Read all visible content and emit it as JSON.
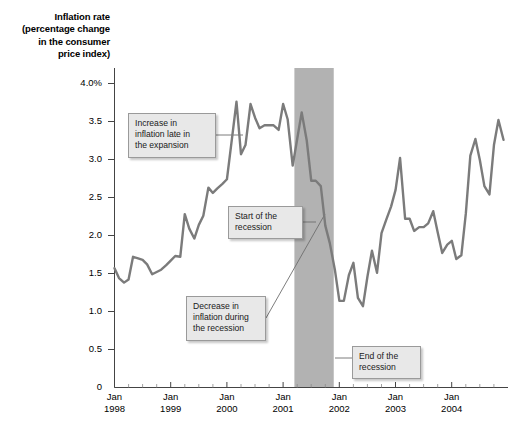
{
  "chart_data": {
    "type": "line",
    "title": "Inflation rate (percentage change in the consumer price index)",
    "title_lines": [
      "Inflation rate",
      "(percentage change",
      "in the consumer",
      "price index)"
    ],
    "xlabel": "",
    "ylabel": "Inflation rate (percentage change in the consumer price index)",
    "ylim": [
      0,
      4.0
    ],
    "yticks": [
      0,
      0.5,
      1.0,
      1.5,
      2.0,
      2.5,
      3.0,
      3.5,
      4.0
    ],
    "ytick_labels": [
      "0",
      "0.5",
      "1.0",
      "1.5",
      "2.0",
      "2.5",
      "3.0",
      "3.5",
      "4.0%"
    ],
    "xlim": [
      1998.0,
      2005.0
    ],
    "xticks": [
      1998,
      1999,
      2000,
      2001,
      2002,
      2003,
      2004
    ],
    "xtick_labels": [
      {
        "month": "Jan",
        "year": "1998"
      },
      {
        "month": "Jan",
        "year": "1999"
      },
      {
        "month": "Jan",
        "year": "2000"
      },
      {
        "month": "Jan",
        "year": "2001"
      },
      {
        "month": "Jan",
        "year": "2002"
      },
      {
        "month": "Jan",
        "year": "2003"
      },
      {
        "month": "Jan",
        "year": "2004"
      }
    ],
    "grid": false,
    "legend": null,
    "line_color": "#7b7b7b",
    "recession_band_color": "#b2b2b2",
    "recession_band": {
      "start": 2001.2,
      "end": 2001.9,
      "label": "recession"
    },
    "series": [
      {
        "name": "Inflation rate",
        "x": [
          1998.0,
          1998.08,
          1998.17,
          1998.25,
          1998.33,
          1998.42,
          1998.5,
          1998.58,
          1998.67,
          1998.75,
          1998.83,
          1998.92,
          1999.0,
          1999.08,
          1999.17,
          1999.25,
          1999.33,
          1999.42,
          1999.5,
          1999.58,
          1999.67,
          1999.75,
          1999.83,
          1999.92,
          2000.0,
          2000.08,
          2000.17,
          2000.25,
          2000.33,
          2000.42,
          2000.5,
          2000.58,
          2000.67,
          2000.75,
          2000.83,
          2000.92,
          2001.0,
          2001.08,
          2001.17,
          2001.25,
          2001.33,
          2001.42,
          2001.5,
          2001.58,
          2001.67,
          2001.75,
          2001.83,
          2001.92,
          2002.0,
          2002.08,
          2002.17,
          2002.25,
          2002.33,
          2002.42,
          2002.5,
          2002.58,
          2002.67,
          2002.75,
          2002.83,
          2002.92,
          2003.0,
          2003.08,
          2003.17,
          2003.25,
          2003.33,
          2003.42,
          2003.5,
          2003.58,
          2003.67,
          2003.75,
          2003.83,
          2003.92,
          2004.0,
          2004.08,
          2004.17,
          2004.25,
          2004.33,
          2004.42,
          2004.5,
          2004.58,
          2004.67,
          2004.75,
          2004.83,
          2004.92
        ],
        "values": [
          1.57,
          1.44,
          1.38,
          1.42,
          1.72,
          1.7,
          1.68,
          1.62,
          1.49,
          1.52,
          1.55,
          1.61,
          1.67,
          1.73,
          1.72,
          2.28,
          2.09,
          1.96,
          2.14,
          2.26,
          2.63,
          2.56,
          2.62,
          2.68,
          2.74,
          3.22,
          3.76,
          3.07,
          3.19,
          3.73,
          3.55,
          3.41,
          3.45,
          3.45,
          3.45,
          3.39,
          3.73,
          3.53,
          2.92,
          3.27,
          3.62,
          3.25,
          2.72,
          2.72,
          2.65,
          2.13,
          1.9,
          1.55,
          1.14,
          1.14,
          1.48,
          1.64,
          1.18,
          1.07,
          1.46,
          1.8,
          1.51,
          2.03,
          2.2,
          2.38,
          2.6,
          3.02,
          2.22,
          2.22,
          2.06,
          2.11,
          2.11,
          2.16,
          2.32,
          2.04,
          1.77,
          1.88,
          1.93,
          1.69,
          1.74,
          2.29,
          3.05,
          3.27,
          2.99,
          2.65,
          2.54,
          3.19,
          3.52,
          3.26
        ]
      }
    ],
    "annotations": [
      {
        "id": "increase-in-inflation",
        "lines": [
          "Increase in",
          "inflation late in",
          "the expansion"
        ],
        "leader_to": {
          "x": 2000.15,
          "y": 3.12
        }
      },
      {
        "id": "start-of-recession",
        "lines": [
          "Start of the",
          "recession"
        ],
        "leader_to": {
          "x": 2001.2,
          "y": 1.52
        }
      },
      {
        "id": "decrease-in-inflation",
        "lines": [
          "Decrease in",
          "inflation during",
          "the recession"
        ],
        "leader_to": {
          "x": 2001.55,
          "y": 2.35
        }
      },
      {
        "id": "end-of-recession",
        "lines": [
          "End of the",
          "recession"
        ],
        "leader_to": {
          "x": 2001.9,
          "y": 0.35
        }
      }
    ]
  }
}
